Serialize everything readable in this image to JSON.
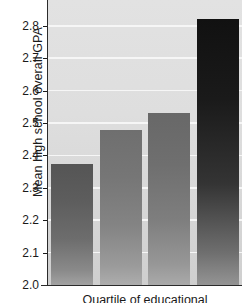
{
  "chart_data": {
    "type": "bar",
    "title": "",
    "xlabel": "Quartile of educational",
    "ylabel": "Mean high school overall GPA",
    "categories": [
      "1",
      "2",
      "3",
      "4"
    ],
    "values": [
      2.375,
      2.48,
      2.53,
      2.82
    ],
    "ylim": [
      2.0,
      2.88
    ],
    "ytick_labels": [
      "2.0",
      "2.1",
      "2.2",
      "2.3",
      "2.4",
      "2.5",
      "2.6",
      "2.7",
      "2.8"
    ],
    "ytick_values": [
      2.0,
      2.1,
      2.2,
      2.3,
      2.4,
      2.5,
      2.6,
      2.7,
      2.8
    ],
    "grid": "horizontal",
    "gridline_color": "#f6f6f6",
    "plot_background": "#dedede",
    "legend": "none",
    "bar_colors": [
      "#6d6d6d",
      "#848484",
      "#7e7e7e",
      "#343434"
    ],
    "axis_color": "#2b2b2b",
    "text_color": "#1a1a1a"
  }
}
